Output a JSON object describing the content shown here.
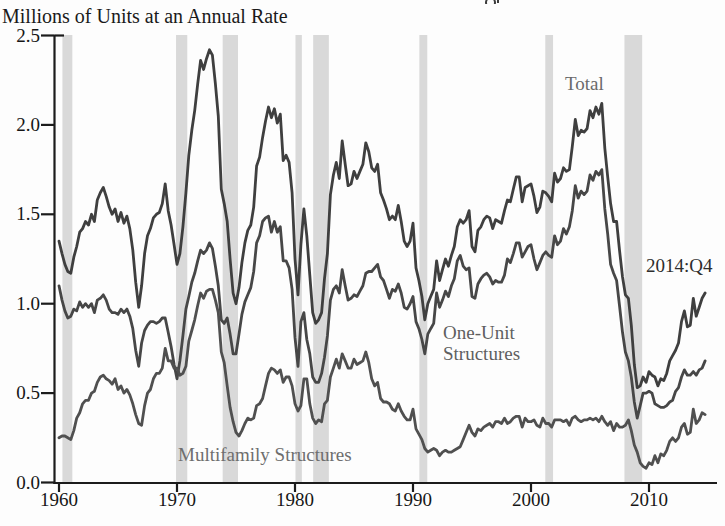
{
  "chart": {
    "subtitle": "Millions of Units at an Annual Rate",
    "series_labels": {
      "total": "Total",
      "one_unit_line1": "One-Unit",
      "one_unit_line2": "Structures",
      "multifamily": "Multifamily Structures"
    },
    "end_label": "2014:Q4",
    "colors": {
      "axis": "#1c1c1c",
      "line_total": "#3f3f3f",
      "line_one_unit": "#474747",
      "line_multifamily": "#505050",
      "recession_band": "#d9d9d9",
      "background": "#fdfdfd"
    }
  },
  "chart_data": {
    "type": "line",
    "subtitle": "Millions of Units at an Annual Rate",
    "xlabel": "",
    "ylabel": "Millions of Units at an Annual Rate",
    "x_start": 1960.0,
    "x_step": 0.25,
    "x_end": 2014.75,
    "frequency": "quarterly",
    "xlim": [
      1959.6,
      2015.8
    ],
    "ylim": [
      0.0,
      2.5
    ],
    "grid": false,
    "legend_position": "inline-annotations",
    "x_ticks": [
      1960,
      1970,
      1980,
      1990,
      2000,
      2010
    ],
    "x_tick_labels": [
      "1960",
      "1970",
      "1980",
      "1990",
      "2000",
      "2010"
    ],
    "y_ticks": [
      0.0,
      0.5,
      1.0,
      1.5,
      2.0,
      2.5
    ],
    "y_tick_labels": [
      "0.0",
      "0.5",
      "1.0",
      "1.5",
      "2.0",
      "2.5"
    ],
    "annotations": [
      {
        "text": "Total",
        "x": 2004.5,
        "y": 2.32
      },
      {
        "text": "One-Unit Structures",
        "x": 1992.7,
        "y": 0.82
      },
      {
        "text": "Multifamily Structures",
        "x": 1970.2,
        "y": 0.17
      },
      {
        "text": "2014:Q4",
        "x": 2012.0,
        "y": 1.22
      }
    ],
    "recessions": [
      [
        1960.29,
        1961.13
      ],
      [
        1969.92,
        1970.87
      ],
      [
        1973.87,
        1975.17
      ],
      [
        1980.04,
        1980.58
      ],
      [
        1981.54,
        1982.87
      ],
      [
        1990.54,
        1991.21
      ],
      [
        2001.21,
        2001.87
      ],
      [
        2007.92,
        2009.42
      ]
    ],
    "series": [
      {
        "name": "Total",
        "values": [
          1.35,
          1.28,
          1.22,
          1.18,
          1.17,
          1.26,
          1.32,
          1.4,
          1.42,
          1.46,
          1.44,
          1.5,
          1.46,
          1.58,
          1.62,
          1.65,
          1.6,
          1.54,
          1.5,
          1.53,
          1.46,
          1.51,
          1.45,
          1.49,
          1.42,
          1.3,
          1.12,
          0.98,
          1.1,
          1.28,
          1.38,
          1.42,
          1.48,
          1.5,
          1.51,
          1.56,
          1.67,
          1.52,
          1.44,
          1.33,
          1.22,
          1.28,
          1.43,
          1.62,
          1.83,
          1.97,
          2.08,
          2.23,
          2.36,
          2.31,
          2.37,
          2.42,
          2.39,
          2.23,
          2.05,
          1.64,
          1.56,
          1.46,
          1.25,
          1.06,
          1.0,
          1.09,
          1.23,
          1.34,
          1.41,
          1.44,
          1.54,
          1.77,
          1.82,
          1.93,
          2.02,
          2.1,
          2.04,
          2.09,
          2.01,
          2.06,
          1.8,
          1.83,
          1.79,
          1.62,
          1.25,
          1.05,
          1.33,
          1.53,
          1.38,
          1.16,
          0.95,
          0.89,
          0.91,
          0.95,
          1.14,
          1.28,
          1.61,
          1.72,
          1.79,
          1.7,
          1.91,
          1.78,
          1.66,
          1.67,
          1.74,
          1.7,
          1.74,
          1.78,
          1.9,
          1.85,
          1.76,
          1.74,
          1.78,
          1.62,
          1.58,
          1.53,
          1.47,
          1.49,
          1.47,
          1.55,
          1.46,
          1.35,
          1.32,
          1.35,
          1.45,
          1.2,
          1.13,
          1.04,
          0.91,
          1.0,
          1.04,
          1.08,
          1.24,
          1.13,
          1.19,
          1.25,
          1.21,
          1.27,
          1.32,
          1.43,
          1.47,
          1.45,
          1.47,
          1.52,
          1.32,
          1.29,
          1.41,
          1.43,
          1.47,
          1.49,
          1.48,
          1.42,
          1.47,
          1.46,
          1.45,
          1.52,
          1.58,
          1.57,
          1.64,
          1.71,
          1.71,
          1.57,
          1.65,
          1.66,
          1.67,
          1.6,
          1.51,
          1.54,
          1.63,
          1.62,
          1.6,
          1.57,
          1.73,
          1.68,
          1.7,
          1.76,
          1.74,
          1.75,
          1.88,
          2.03,
          1.94,
          1.97,
          1.96,
          1.98,
          2.08,
          2.04,
          2.1,
          2.06,
          2.12,
          1.87,
          1.71,
          1.56,
          1.46,
          1.46,
          1.3,
          1.15,
          1.05,
          1.03,
          0.88,
          0.66,
          0.53,
          0.54,
          0.59,
          0.56,
          0.62,
          0.6,
          0.59,
          0.54,
          0.58,
          0.57,
          0.61,
          0.68,
          0.71,
          0.74,
          0.78,
          0.9,
          0.96,
          0.87,
          0.88,
          1.03,
          0.93,
          0.98,
          1.03,
          1.06
        ]
      },
      {
        "name": "One-Unit Structures",
        "values": [
          1.1,
          1.02,
          0.96,
          0.92,
          0.93,
          0.97,
          0.96,
          1.01,
          0.98,
          1.0,
          0.98,
          1.0,
          0.95,
          1.02,
          1.03,
          1.05,
          1.02,
          0.97,
          0.95,
          0.95,
          0.94,
          0.97,
          0.95,
          0.97,
          0.93,
          0.86,
          0.74,
          0.65,
          0.78,
          0.85,
          0.88,
          0.9,
          0.9,
          0.89,
          0.9,
          0.92,
          0.92,
          0.84,
          0.76,
          0.66,
          0.58,
          0.68,
          0.82,
          0.97,
          1.04,
          1.12,
          1.17,
          1.24,
          1.3,
          1.28,
          1.3,
          1.34,
          1.31,
          1.21,
          1.1,
          0.91,
          0.89,
          0.92,
          0.83,
          0.72,
          0.72,
          0.83,
          0.94,
          1.01,
          1.05,
          1.09,
          1.18,
          1.34,
          1.38,
          1.46,
          1.48,
          1.49,
          1.4,
          1.46,
          1.4,
          1.43,
          1.24,
          1.24,
          1.2,
          1.08,
          0.81,
          0.65,
          0.9,
          0.95,
          0.8,
          0.72,
          0.59,
          0.56,
          0.56,
          0.61,
          0.7,
          0.82,
          1.02,
          1.08,
          1.1,
          1.06,
          1.19,
          1.1,
          1.02,
          1.03,
          1.05,
          1.04,
          1.07,
          1.1,
          1.17,
          1.18,
          1.18,
          1.2,
          1.22,
          1.15,
          1.13,
          1.08,
          1.03,
          1.08,
          1.07,
          1.11,
          1.06,
          0.98,
          0.97,
          1.0,
          1.04,
          0.9,
          0.86,
          0.8,
          0.72,
          0.83,
          0.86,
          0.89,
          1.06,
          0.98,
          1.02,
          1.07,
          1.04,
          1.1,
          1.14,
          1.24,
          1.27,
          1.21,
          1.19,
          1.2,
          1.04,
          1.03,
          1.11,
          1.14,
          1.16,
          1.17,
          1.15,
          1.11,
          1.13,
          1.12,
          1.12,
          1.16,
          1.25,
          1.23,
          1.28,
          1.34,
          1.34,
          1.26,
          1.29,
          1.32,
          1.33,
          1.25,
          1.19,
          1.23,
          1.27,
          1.29,
          1.27,
          1.26,
          1.38,
          1.33,
          1.35,
          1.42,
          1.39,
          1.43,
          1.52,
          1.66,
          1.59,
          1.63,
          1.61,
          1.63,
          1.72,
          1.69,
          1.74,
          1.72,
          1.75,
          1.53,
          1.39,
          1.22,
          1.17,
          1.13,
          0.99,
          0.84,
          0.73,
          0.68,
          0.59,
          0.45,
          0.36,
          0.43,
          0.5,
          0.5,
          0.51,
          0.5,
          0.44,
          0.43,
          0.42,
          0.42,
          0.43,
          0.45,
          0.46,
          0.51,
          0.53,
          0.59,
          0.63,
          0.6,
          0.6,
          0.62,
          0.6,
          0.63,
          0.64,
          0.68
        ]
      },
      {
        "name": "Multifamily Structures",
        "values": [
          0.25,
          0.26,
          0.26,
          0.25,
          0.24,
          0.29,
          0.36,
          0.39,
          0.44,
          0.46,
          0.46,
          0.5,
          0.51,
          0.56,
          0.59,
          0.6,
          0.58,
          0.57,
          0.55,
          0.58,
          0.52,
          0.54,
          0.5,
          0.52,
          0.49,
          0.44,
          0.38,
          0.33,
          0.32,
          0.43,
          0.5,
          0.52,
          0.58,
          0.61,
          0.61,
          0.64,
          0.75,
          0.68,
          0.68,
          0.64,
          0.64,
          0.6,
          0.61,
          0.65,
          0.79,
          0.85,
          0.91,
          0.99,
          1.06,
          1.03,
          1.07,
          1.08,
          1.08,
          1.02,
          0.95,
          0.73,
          0.67,
          0.54,
          0.42,
          0.34,
          0.28,
          0.26,
          0.29,
          0.33,
          0.36,
          0.35,
          0.36,
          0.43,
          0.44,
          0.47,
          0.54,
          0.61,
          0.64,
          0.63,
          0.61,
          0.63,
          0.56,
          0.59,
          0.59,
          0.54,
          0.44,
          0.4,
          0.43,
          0.58,
          0.58,
          0.44,
          0.36,
          0.33,
          0.35,
          0.34,
          0.44,
          0.46,
          0.59,
          0.64,
          0.69,
          0.64,
          0.72,
          0.68,
          0.64,
          0.64,
          0.69,
          0.66,
          0.67,
          0.68,
          0.73,
          0.67,
          0.58,
          0.54,
          0.56,
          0.47,
          0.45,
          0.45,
          0.44,
          0.41,
          0.4,
          0.44,
          0.4,
          0.37,
          0.35,
          0.35,
          0.41,
          0.3,
          0.27,
          0.24,
          0.19,
          0.17,
          0.18,
          0.19,
          0.18,
          0.15,
          0.17,
          0.18,
          0.17,
          0.17,
          0.18,
          0.19,
          0.2,
          0.24,
          0.28,
          0.32,
          0.28,
          0.26,
          0.3,
          0.29,
          0.31,
          0.32,
          0.33,
          0.31,
          0.34,
          0.34,
          0.33,
          0.36,
          0.33,
          0.34,
          0.36,
          0.37,
          0.37,
          0.31,
          0.36,
          0.34,
          0.34,
          0.35,
          0.32,
          0.31,
          0.36,
          0.33,
          0.33,
          0.31,
          0.35,
          0.35,
          0.35,
          0.34,
          0.35,
          0.32,
          0.36,
          0.37,
          0.35,
          0.34,
          0.35,
          0.35,
          0.36,
          0.35,
          0.36,
          0.34,
          0.37,
          0.34,
          0.32,
          0.34,
          0.29,
          0.33,
          0.31,
          0.31,
          0.32,
          0.35,
          0.29,
          0.21,
          0.17,
          0.11,
          0.09,
          0.08,
          0.11,
          0.1,
          0.15,
          0.11,
          0.16,
          0.15,
          0.18,
          0.23,
          0.25,
          0.23,
          0.25,
          0.31,
          0.33,
          0.27,
          0.28,
          0.41,
          0.33,
          0.35,
          0.39,
          0.38
        ]
      }
    ]
  }
}
